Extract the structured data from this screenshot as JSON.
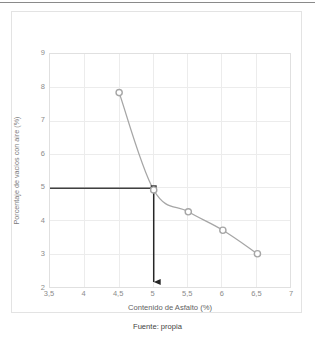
{
  "figure": {
    "caption": "Fuente: propia"
  },
  "chart_data": {
    "type": "line",
    "title": "",
    "xlabel": "Contenido de Asfalto (%)",
    "ylabel": "Porcentaje de vacíos con aire (%)",
    "xlim": [
      3.5,
      7
    ],
    "ylim": [
      2,
      9
    ],
    "grid": true,
    "legend_position": "none",
    "x_tick_labels": [
      "3,5",
      "4",
      "4,5",
      "5",
      "5,5",
      "6",
      "6,5",
      "7"
    ],
    "x_ticks": [
      3.5,
      4,
      4.5,
      5,
      5.5,
      6,
      6.5,
      7
    ],
    "y_tick_labels": [
      "2",
      "3",
      "4",
      "5",
      "6",
      "7",
      "8",
      "9"
    ],
    "y_ticks": [
      2,
      3,
      4,
      5,
      6,
      7,
      8,
      9
    ],
    "series": [
      {
        "name": "Porcentaje de vacíos con aire",
        "line_color": "#a6a6a6",
        "marker": "circle",
        "marker_edge_color": "#a6a6a6",
        "marker_face_color": "#ffffff",
        "x": [
          4.5,
          5,
          5.5,
          6,
          6.5
        ],
        "values": [
          7.85,
          4.95,
          4.3,
          3.75,
          3.05
        ]
      }
    ],
    "annotations": [
      {
        "name": "design-air-voids-guide",
        "type": "horizontal-line",
        "y": 5,
        "x_from": 3.5,
        "x_to": 5,
        "color": "#404040"
      },
      {
        "name": "optimum-asphalt-content-arrow",
        "type": "vertical-arrow",
        "x": 5,
        "y_from": 5,
        "y_to": 2,
        "color": "#262626"
      },
      {
        "name": "intersection-marker",
        "type": "square-marker",
        "x": 5,
        "y": 5,
        "color": "#333333"
      }
    ]
  }
}
